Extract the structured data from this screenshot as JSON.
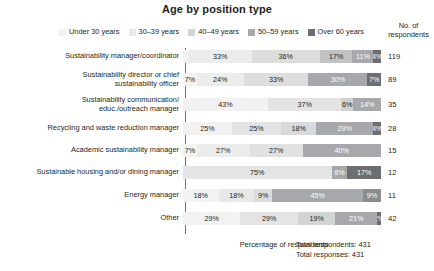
{
  "chart_data": {
    "type": "bar",
    "subtype": "horizontal-stacked-100",
    "title": "Age by position type",
    "xlabel": "Percentage of respondents",
    "ylabel": "",
    "xlim": [
      0,
      100
    ],
    "grid": false,
    "legend_position": "top",
    "legend": [
      "Under 30 years",
      "30–39 years",
      "40–49 years",
      "50–59 years",
      "Over 60 years"
    ],
    "series_colors": [
      "#f2f2f2",
      "#e0e0e0",
      "#c6c7c9",
      "#a6a8ab",
      "#808285"
    ],
    "categories": [
      "Sustainability manager/coordinator",
      "Sustainability director or chief sustainability officer",
      "Sustainability communication/ educ./outreach manager",
      "Recycling and waste reduction manager",
      "Academic sustainability manager",
      "Sustainable housing and/or dining manager",
      "Energy manager",
      "Other"
    ],
    "series": [
      {
        "name": "Under 30 years",
        "values": [
          3,
          7,
          0,
          25,
          7,
          0,
          18,
          0
        ]
      },
      {
        "name": "30–39 years",
        "values": [
          33,
          24,
          43,
          25,
          27,
          0,
          18,
          29
        ]
      },
      {
        "name": "40–49 years",
        "values": [
          36,
          33,
          37,
          18,
          27,
          75,
          9,
          29
        ]
      },
      {
        "name": "50–59 years",
        "values": [
          17,
          30,
          6,
          29,
          40,
          8,
          45,
          19
        ]
      },
      {
        "name": "Over 60 years",
        "values": [
          11,
          7,
          14,
          4,
          0,
          17,
          9,
          21
        ]
      },
      {
        "name": "Over 60 years overflow",
        "values": [
          4,
          0,
          0,
          0,
          0,
          0,
          0,
          2
        ]
      }
    ],
    "respondents": [
      119,
      89,
      35,
      28,
      15,
      12,
      11,
      42
    ],
    "total_respondents": 431,
    "total_responses": 431
  },
  "legend": {
    "items": [
      {
        "label": "Under 30 years",
        "color": "#f2f2f2"
      },
      {
        "label": "30–39 years",
        "color": "#e8e8e8"
      },
      {
        "label": "40–49 years",
        "color": "#d2d3d5"
      },
      {
        "label": "50–59 years",
        "color": "#a6a8ab"
      },
      {
        "label": "Over 60 years",
        "color": "#6d6e71"
      }
    ]
  },
  "header": {
    "title": "Age by position type",
    "respondents_column": "No. of\nrespondents",
    "respondents_column_l1": "No. of",
    "respondents_column_l2": "respondents"
  },
  "rows": [
    {
      "label_l1": "Sustainability manager/coordinator",
      "label_l2": "",
      "respondents": "119",
      "segments": [
        {
          "pct": 3,
          "label": "",
          "color": "#f2f2f2",
          "text": "#231f20"
        },
        {
          "pct": 33,
          "label": "33%",
          "color": "#ececec",
          "text": "#231f20"
        },
        {
          "pct": 36,
          "label": "36%",
          "color": "#dddddd",
          "text": "#231f20"
        },
        {
          "pct": 17,
          "label": "17%",
          "color": "#c1c2c4",
          "text": "#231f20"
        },
        {
          "pct": 11,
          "label": "11%",
          "color": "#a6a8ab",
          "text": "#ffffff"
        },
        {
          "pct": 4,
          "label": "4%",
          "color": "#6d6e71",
          "text": "#ffffff"
        }
      ]
    },
    {
      "label_l1": "Sustainability director or chief",
      "label_l2": "sustainability officer",
      "respondents": "89",
      "segments": [
        {
          "pct": 7,
          "label": "7%",
          "color": "#f2f2f2",
          "text": "#231f20"
        },
        {
          "pct": 24,
          "label": "24%",
          "color": "#ececec",
          "text": "#231f20"
        },
        {
          "pct": 33,
          "label": "33%",
          "color": "#dddddd",
          "text": "#231f20"
        },
        {
          "pct": 30,
          "label": "30%",
          "color": "#a6a8ab",
          "text": "#ffffff"
        },
        {
          "pct": 7,
          "label": "7%",
          "color": "#6d6e71",
          "text": "#ffffff"
        }
      ]
    },
    {
      "label_l1": "Sustainability communication/",
      "label_l2": "educ./outreach manager",
      "respondents": "35",
      "segments": [
        {
          "pct": 43,
          "label": "43%",
          "color": "#f2f2f2",
          "text": "#231f20"
        },
        {
          "pct": 37,
          "label": "37%",
          "color": "#e4e4e4",
          "text": "#231f20"
        },
        {
          "pct": 6,
          "label": "6%",
          "color": "#cfd0d2",
          "text": "#231f20"
        },
        {
          "pct": 14,
          "label": "14%",
          "color": "#a6a8ab",
          "text": "#ffffff"
        }
      ]
    },
    {
      "label_l1": "Recycling and waste reduction manager",
      "label_l2": "",
      "respondents": "28",
      "segments": [
        {
          "pct": 25,
          "label": "25%",
          "color": "#f2f2f2",
          "text": "#231f20"
        },
        {
          "pct": 25,
          "label": "25%",
          "color": "#e4e4e4",
          "text": "#231f20"
        },
        {
          "pct": 18,
          "label": "18%",
          "color": "#d8d9da",
          "text": "#231f20"
        },
        {
          "pct": 29,
          "label": "29%",
          "color": "#a6a8ab",
          "text": "#ffffff"
        },
        {
          "pct": 4,
          "label": "4%",
          "color": "#6d6e71",
          "text": "#ffffff"
        }
      ]
    },
    {
      "label_l1": "Academic sustainability manager",
      "label_l2": "",
      "respondents": "15",
      "segments": [
        {
          "pct": 7,
          "label": "7%",
          "color": "#f2f2f2",
          "text": "#231f20"
        },
        {
          "pct": 27,
          "label": "27%",
          "color": "#ececec",
          "text": "#231f20"
        },
        {
          "pct": 27,
          "label": "27%",
          "color": "#e0e1e2",
          "text": "#231f20"
        },
        {
          "pct": 40,
          "label": "40%",
          "color": "#a6a8ab",
          "text": "#ffffff"
        }
      ]
    },
    {
      "label_l1": "Sustainable housing and/or dining manager",
      "label_l2": "",
      "respondents": "12",
      "segments": [
        {
          "pct": 75,
          "label": "75%",
          "color": "#e4e4e4",
          "text": "#231f20"
        },
        {
          "pct": 8,
          "label": "8%",
          "color": "#a6a8ab",
          "text": "#ffffff"
        },
        {
          "pct": 17,
          "label": "17%",
          "color": "#6d6e71",
          "text": "#ffffff"
        }
      ]
    },
    {
      "label_l1": "Energy manager",
      "label_l2": "",
      "respondents": "11",
      "segments": [
        {
          "pct": 18,
          "label": "18%",
          "color": "#f2f2f2",
          "text": "#231f20"
        },
        {
          "pct": 18,
          "label": "18%",
          "color": "#e8e8e8",
          "text": "#231f20"
        },
        {
          "pct": 9,
          "label": "9%",
          "color": "#dcdcdc",
          "text": "#231f20"
        },
        {
          "pct": 46,
          "label": "45%",
          "color": "#a6a8ab",
          "text": "#ffffff"
        },
        {
          "pct": 9,
          "label": "9%",
          "color": "#8a8c8e",
          "text": "#ffffff"
        }
      ]
    },
    {
      "label_l1": "Other",
      "label_l2": "",
      "respondents": "42",
      "segments": [
        {
          "pct": 29,
          "label": "29%",
          "color": "#f2f2f2",
          "text": "#231f20"
        },
        {
          "pct": 29,
          "label": "29%",
          "color": "#e4e4e4",
          "text": "#231f20"
        },
        {
          "pct": 19,
          "label": "19%",
          "color": "#d2d3d5",
          "text": "#231f20"
        },
        {
          "pct": 21,
          "label": "21%",
          "color": "#a6a8ab",
          "text": "#ffffff"
        },
        {
          "pct": 2,
          "label": "2%",
          "color": "#6d6e71",
          "text": "#ffffff"
        }
      ]
    }
  ],
  "footer": {
    "axis_label": "Percentage of respondents",
    "total_respondents": "Total respondents: 431",
    "total_responses": "Total responses: 431"
  }
}
